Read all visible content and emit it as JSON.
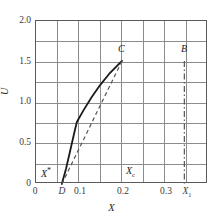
{
  "chart_data": {
    "type": "line",
    "title": "",
    "xlabel": "X",
    "ylabel": "U",
    "xlim": [
      0.0,
      0.4
    ],
    "ylim": [
      0.0,
      2.0
    ],
    "grid": true,
    "grid_x_step": 0.05,
    "grid_y_step": 0.25,
    "legend": "none",
    "xticks": [
      {
        "value": 0.0,
        "label": "0"
      },
      {
        "value": 0.1,
        "label": "0.1"
      },
      {
        "value": 0.2,
        "label": "0.2"
      },
      {
        "value": 0.3,
        "label": "0.3"
      }
    ],
    "yticks": [
      {
        "value": 0.0,
        "label": "0"
      },
      {
        "value": 0.5,
        "label": "0.5"
      },
      {
        "value": 1.0,
        "label": "1.0"
      },
      {
        "value": 1.5,
        "label": "1.5"
      },
      {
        "value": 2.0,
        "label": "2.0"
      }
    ],
    "series": [
      {
        "name": "solid-curve-DC",
        "style": "solid",
        "color": "#1a1a1a",
        "width": 1.8,
        "points": [
          [
            0.06,
            0.0
          ],
          [
            0.07,
            0.19
          ],
          [
            0.08,
            0.42
          ],
          [
            0.09,
            0.65
          ],
          [
            0.095,
            0.76
          ],
          [
            0.11,
            0.9
          ],
          [
            0.13,
            1.07
          ],
          [
            0.15,
            1.22
          ],
          [
            0.17,
            1.35
          ],
          [
            0.2,
            1.51
          ]
        ]
      },
      {
        "name": "dashed-chord-DC",
        "style": "dashed",
        "color": "#555555",
        "width": 1.2,
        "points": [
          [
            0.06,
            0.0
          ],
          [
            0.2,
            1.51
          ]
        ]
      },
      {
        "name": "dash-dot-vertical-B",
        "style": "dash-dot",
        "color": "#555555",
        "width": 1.2,
        "points": [
          [
            0.345,
            1.51
          ],
          [
            0.345,
            0.0
          ]
        ]
      }
    ],
    "annotations": [
      {
        "id": "label-C",
        "text": "C",
        "x": 0.2,
        "y": 1.58,
        "anchor": "center"
      },
      {
        "id": "label-B",
        "text": "B",
        "x": 0.345,
        "y": 1.58,
        "anchor": "center"
      },
      {
        "id": "label-D",
        "text": "D",
        "x": 0.06,
        "y": -0.09,
        "anchor": "center"
      },
      {
        "id": "label-Xstar",
        "text": "X*",
        "x": 0.018,
        "y": 0.14,
        "anchor": "left"
      },
      {
        "id": "label-Xc",
        "text": "Xc",
        "x": 0.213,
        "y": 0.14,
        "anchor": "left"
      },
      {
        "id": "label-X1",
        "text": "X1",
        "x": 0.345,
        "y": -0.09,
        "anchor": "center"
      }
    ]
  },
  "annotation_text": {
    "C": "C",
    "B": "B",
    "D": "D",
    "X_star_base": "X",
    "X_star_sup": "*",
    "X_c_base": "X",
    "X_c_sub": "c",
    "X_1_base": "X",
    "X_1_sub": "1"
  },
  "axis_titles": {
    "x": "X",
    "y": "U"
  }
}
